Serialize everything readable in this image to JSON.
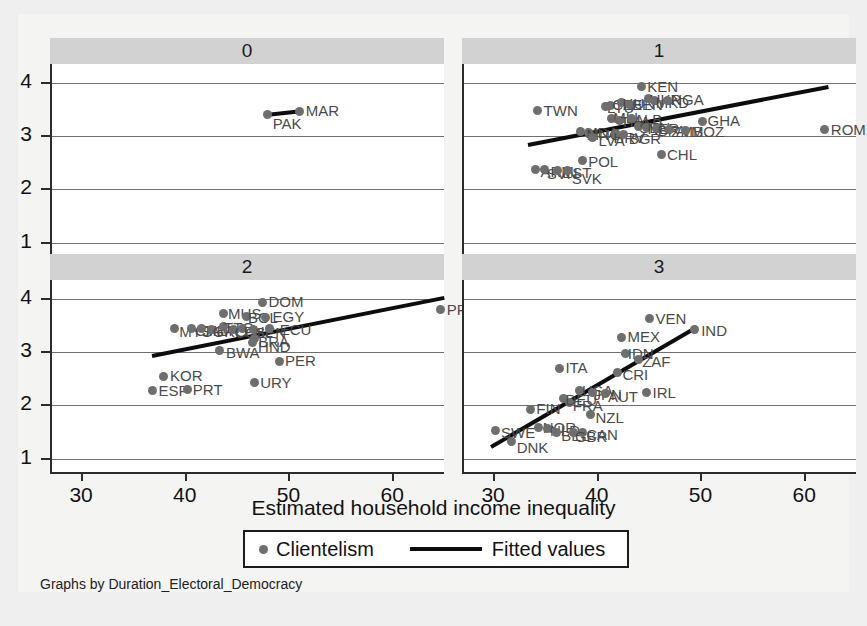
{
  "figure": {
    "xlabel": "Estimated household income inequality",
    "footnote": "Graphs by Duration_Electoral_Democracy",
    "legend": {
      "series_label": "Clientelism",
      "fit_label": "Fitted values"
    },
    "colors": {
      "point": "#6e6e6e",
      "fit_line": "#0d0d0d",
      "panel_header": "#d2d2d2",
      "background": "#efefef",
      "plot_background": "#ffffff",
      "gridline": "#6f6f6f",
      "axis": "#2b2b2b"
    }
  },
  "chart_data": {
    "type": "scatter",
    "title": "",
    "xlabel": "Estimated household income inequality",
    "ylabel": "",
    "xlim": [
      27,
      65
    ],
    "ylim": [
      0.75,
      4.35
    ],
    "xticks": [
      30,
      40,
      50,
      60
    ],
    "yticks": [
      1,
      2,
      3,
      4
    ],
    "grid": "horizontal",
    "legend_position": "bottom-center",
    "facet_variable": "Duration_Electoral_Democracy",
    "panels": [
      {
        "label": "0",
        "points": [
          {
            "code": "PAK",
            "x": 47.8,
            "y": 3.4,
            "lx": 5,
            "ly": 9
          },
          {
            "code": "MAR",
            "x": 50.9,
            "y": 3.46,
            "lx": 6,
            "ly": 0
          }
        ],
        "fit": {
          "x1": 47.6,
          "y1": 3.4,
          "x2": 51.0,
          "y2": 3.47
        }
      },
      {
        "label": "1",
        "points": [
          {
            "code": "TWN",
            "x": 34.1,
            "y": 3.47,
            "lx": 6,
            "ly": 0
          },
          {
            "code": "MDA",
            "x": 38.2,
            "y": 3.08,
            "lx": 5,
            "ly": 1
          },
          {
            "code": "MNG",
            "x": 39.0,
            "y": 3.07,
            "lx": -2,
            "ly": 3
          },
          {
            "code": "LVA",
            "x": 39.4,
            "y": 2.98,
            "lx": 6,
            "ly": 4
          },
          {
            "code": "ARM",
            "x": 33.9,
            "y": 2.38,
            "lx": 5,
            "ly": 3
          },
          {
            "code": "SVN",
            "x": 34.8,
            "y": 2.37,
            "lx": 2,
            "ly": 4
          },
          {
            "code": "EST",
            "x": 36.0,
            "y": 2.36,
            "lx": 0,
            "ly": 3
          },
          {
            "code": "SVK",
            "x": 37.0,
            "y": 2.35,
            "lx": 4,
            "ly": 8
          },
          {
            "code": "POL",
            "x": 38.4,
            "y": 2.55,
            "lx": 6,
            "ly": 2
          },
          {
            "code": "HRV",
            "x": 41.6,
            "y": 3.04,
            "lx": -2,
            "ly": 4
          },
          {
            "code": "BGR",
            "x": 42.4,
            "y": 3.02,
            "lx": 0,
            "ly": 4
          },
          {
            "code": "LTU",
            "x": 40.6,
            "y": 3.55,
            "lx": 2,
            "ly": 1
          },
          {
            "code": "CZE",
            "x": 41.1,
            "y": 3.58,
            "lx": 2,
            "ly": 0
          },
          {
            "code": "HUN",
            "x": 42.2,
            "y": 3.62,
            "lx": 1,
            "ly": 1
          },
          {
            "code": "BEN",
            "x": 43.0,
            "y": 3.6,
            "lx": 2,
            "ly": 1
          },
          {
            "code": "MLI",
            "x": 41.2,
            "y": 3.33,
            "lx": 2,
            "ly": 0
          },
          {
            "code": "THA",
            "x": 42.0,
            "y": 3.3,
            "lx": 1,
            "ly": 2
          },
          {
            "code": "ALB",
            "x": 43.2,
            "y": 3.32,
            "lx": 2,
            "ly": 1
          },
          {
            "code": "KEN",
            "x": 44.1,
            "y": 3.92,
            "lx": 6,
            "ly": 0
          },
          {
            "code": "UKR",
            "x": 44.8,
            "y": 3.7,
            "lx": 1,
            "ly": 1
          },
          {
            "code": "MKD",
            "x": 45.4,
            "y": 3.66,
            "lx": 1,
            "ly": 2
          },
          {
            "code": "NGA",
            "x": 46.6,
            "y": 3.67,
            "lx": 4,
            "ly": 0
          },
          {
            "code": "SEN",
            "x": 43.8,
            "y": 3.18,
            "lx": 1,
            "ly": 2
          },
          {
            "code": "NER",
            "x": 44.6,
            "y": 3.16,
            "lx": 1,
            "ly": 2
          },
          {
            "code": "BFA",
            "x": 45.6,
            "y": 3.14,
            "lx": 1,
            "ly": 2
          },
          {
            "code": "ZMB",
            "x": 46.8,
            "y": 3.12,
            "lx": 2,
            "ly": 2
          },
          {
            "code": "MOZ",
            "x": 48.4,
            "y": 3.11,
            "lx": 5,
            "ly": 2
          },
          {
            "code": "GHA",
            "x": 50.0,
            "y": 3.28,
            "lx": 5,
            "ly": 0
          },
          {
            "code": "CHL",
            "x": 46.0,
            "y": 2.66,
            "lx": 6,
            "ly": 1
          },
          {
            "code": "ROM",
            "x": 61.8,
            "y": 3.12,
            "lx": 6,
            "ly": 0
          }
        ],
        "fit": {
          "x1": 33.2,
          "y1": 2.84,
          "x2": 62.2,
          "y2": 3.93
        }
      },
      {
        "label": "2",
        "points": [
          {
            "code": "ESP",
            "x": 36.7,
            "y": 2.28,
            "lx": 6,
            "ly": 1
          },
          {
            "code": "KOR",
            "x": 37.8,
            "y": 2.55,
            "lx": 6,
            "ly": 0
          },
          {
            "code": "PRT",
            "x": 40.1,
            "y": 2.3,
            "lx": 5,
            "ly": 1
          },
          {
            "code": "MYS",
            "x": 38.8,
            "y": 3.44,
            "lx": 5,
            "ly": 3
          },
          {
            "code": "CHE",
            "x": 40.5,
            "y": 3.44,
            "lx": 3,
            "ly": 2
          },
          {
            "code": "JAM",
            "x": 41.4,
            "y": 3.45,
            "lx": 1,
            "ly": 3
          },
          {
            "code": "GRC",
            "x": 42.4,
            "y": 3.43,
            "lx": 1,
            "ly": 3
          },
          {
            "code": "TTO",
            "x": 43.5,
            "y": 3.48,
            "lx": 1,
            "ly": 2
          },
          {
            "code": "COL",
            "x": 44.5,
            "y": 3.42,
            "lx": 1,
            "ly": 3
          },
          {
            "code": "PHL",
            "x": 45.4,
            "y": 3.44,
            "lx": 1,
            "ly": 3
          },
          {
            "code": "SEN",
            "x": 46.4,
            "y": 3.42,
            "lx": 2,
            "ly": 3
          },
          {
            "code": "ECU",
            "x": 48.0,
            "y": 3.45,
            "lx": 10,
            "ly": 2
          },
          {
            "code": "MUS",
            "x": 43.5,
            "y": 3.72,
            "lx": 5,
            "ly": 0
          },
          {
            "code": "BOL",
            "x": 45.8,
            "y": 3.66,
            "lx": 1,
            "ly": 1
          },
          {
            "code": "EGY",
            "x": 47.6,
            "y": 3.65,
            "lx": 7,
            "ly": 0
          },
          {
            "code": "DOM",
            "x": 47.3,
            "y": 3.93,
            "lx": 6,
            "ly": 0
          },
          {
            "code": "BRA",
            "x": 46.5,
            "y": 3.25,
            "lx": 4,
            "ly": 3
          },
          {
            "code": "HND",
            "x": 46.3,
            "y": 3.18,
            "lx": 6,
            "ly": 5
          },
          {
            "code": "BWA",
            "x": 43.2,
            "y": 3.02,
            "lx": 6,
            "ly": 2
          },
          {
            "code": "PER",
            "x": 48.9,
            "y": 2.83,
            "lx": 6,
            "ly": 0
          },
          {
            "code": "URY",
            "x": 46.5,
            "y": 2.42,
            "lx": 6,
            "ly": 0
          },
          {
            "code": "PRY",
            "x": 64.5,
            "y": 3.79,
            "lx": 6,
            "ly": 0
          }
        ],
        "fit": {
          "x1": 36.6,
          "y1": 2.93,
          "x2": 64.8,
          "y2": 4.02
        }
      },
      {
        "label": "3",
        "points": [
          {
            "code": "SWE",
            "x": 30.0,
            "y": 1.52,
            "lx": 6,
            "ly": 2
          },
          {
            "code": "DNK",
            "x": 31.6,
            "y": 1.32,
            "lx": 5,
            "ly": 6
          },
          {
            "code": "NOR",
            "x": 34.2,
            "y": 1.58,
            "lx": 4,
            "ly": 0
          },
          {
            "code": "NLD",
            "x": 35.1,
            "y": 1.56,
            "lx": 2,
            "ly": 2
          },
          {
            "code": "BEL",
            "x": 35.9,
            "y": 1.5,
            "lx": 0,
            "ly": 4
          },
          {
            "code": "CAN",
            "x": 38.4,
            "y": 1.5,
            "lx": 4,
            "ly": 3
          },
          {
            "code": "GBR",
            "x": 37.6,
            "y": 1.49,
            "lx": 1,
            "ly": 4
          },
          {
            "code": "FIN",
            "x": 33.4,
            "y": 1.93,
            "lx": 6,
            "ly": 0
          },
          {
            "code": "FRA",
            "x": 37.2,
            "y": 2.05,
            "lx": 3,
            "ly": 3
          },
          {
            "code": "NZL",
            "x": 39.2,
            "y": 1.82,
            "lx": 5,
            "ly": 3
          },
          {
            "code": "DEU",
            "x": 36.6,
            "y": 2.13,
            "lx": 2,
            "ly": 2
          },
          {
            "code": "USA",
            "x": 38.1,
            "y": 2.28,
            "lx": 3,
            "ly": 1
          },
          {
            "code": "JPN",
            "x": 39.4,
            "y": 2.24,
            "lx": 1,
            "ly": 2
          },
          {
            "code": "AUT",
            "x": 40.6,
            "y": 2.22,
            "lx": 3,
            "ly": 3
          },
          {
            "code": "IRL",
            "x": 44.6,
            "y": 2.24,
            "lx": 6,
            "ly": 0
          },
          {
            "code": "ITA",
            "x": 36.2,
            "y": 2.7,
            "lx": 6,
            "ly": 0
          },
          {
            "code": "CRI",
            "x": 41.8,
            "y": 2.62,
            "lx": 5,
            "ly": 3
          },
          {
            "code": "IDN",
            "x": 42.6,
            "y": 2.98,
            "lx": 2,
            "ly": 1
          },
          {
            "code": "ZAF",
            "x": 43.8,
            "y": 2.86,
            "lx": 4,
            "ly": 3
          },
          {
            "code": "MEX",
            "x": 42.2,
            "y": 3.28,
            "lx": 6,
            "ly": 0
          },
          {
            "code": "VEN",
            "x": 44.9,
            "y": 3.62,
            "lx": 6,
            "ly": 0
          },
          {
            "code": "IND",
            "x": 49.2,
            "y": 3.42,
            "lx": 7,
            "ly": 1
          }
        ],
        "fit": {
          "x1": 29.6,
          "y1": 1.22,
          "x2": 49.4,
          "y2": 3.46
        }
      }
    ]
  }
}
